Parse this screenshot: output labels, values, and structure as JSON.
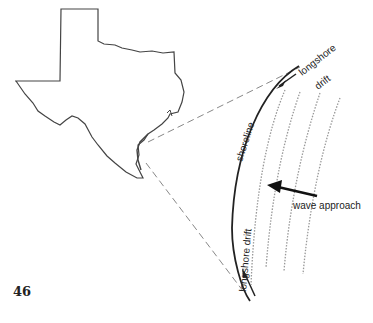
{
  "figure": {
    "page_number": "46",
    "labels": {
      "longshore_drift_top_1": "longshore",
      "longshore_drift_top_2": "drift",
      "shoreline": "shoreline",
      "longshore_drift_bottom": "longshore drift",
      "wave_approach": "wave approach"
    },
    "colors": {
      "line": "#222222",
      "dashed": "#888888",
      "waves": "#999999"
    }
  }
}
